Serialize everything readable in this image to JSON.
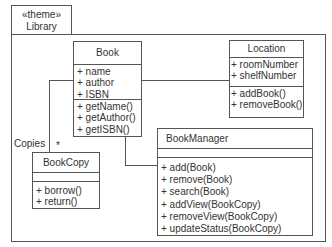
{
  "package": {
    "stereotype": "«theme»",
    "name": "Library"
  },
  "classes": {
    "book": {
      "name": "Book",
      "attributes": [
        "+ name",
        "+ author",
        "+ ISBN"
      ],
      "methods": [
        "+ getName()",
        "+ getAuthor()",
        "+ getISBN()"
      ]
    },
    "location": {
      "name": "Location",
      "attributes": [
        "+ roomNumber",
        "+ shelfNumber"
      ],
      "methods": [
        "+ addBook()",
        "+ removeBook()"
      ]
    },
    "bookcopy": {
      "name": "BookCopy",
      "attributes": [],
      "methods": [
        "+ borrow()",
        "+ return()"
      ]
    },
    "bookmanager": {
      "name": "BookManager",
      "attributes": [],
      "methods": [
        "+ add(Book)",
        "+ remove(Book)",
        "+ search(Book)",
        "+ addView(BookCopy)",
        "+ removeView(BookCopy)",
        "+ updateStatus(BookCopy)"
      ]
    }
  },
  "associations": {
    "book_bookcopy": {
      "role": "Copies",
      "multiplicity": "*"
    },
    "book_location": {},
    "book_bookmanager": {}
  }
}
